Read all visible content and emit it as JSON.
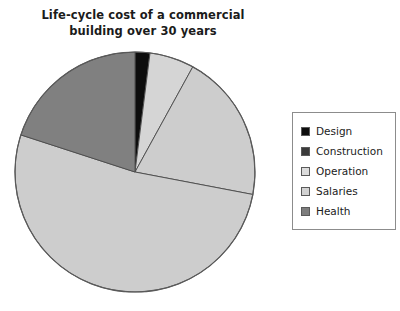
{
  "chart_data": {
    "type": "pie",
    "title": "Life-cycle cost of a commercial\nbuilding over 30 years",
    "title_line1": "Life-cycle cost of a commercial",
    "title_line2": "building over 30 years",
    "xlabel": "",
    "ylabel": "",
    "legend_position": "right",
    "grid": false,
    "start_angle_deg": 90,
    "direction": "clockwise",
    "categories": [
      "Design",
      "Construction",
      "Operation",
      "Salaries",
      "Health"
    ],
    "values": [
      2,
      6,
      20,
      52,
      20
    ],
    "units": "percent",
    "slices": [
      {
        "label": "Design",
        "value": 2,
        "color": "#0d0d0d"
      },
      {
        "label": "Construction",
        "value": 6,
        "color": "#d5d5d5"
      },
      {
        "label": "Operation",
        "value": 20,
        "color": "#cdcdcd"
      },
      {
        "label": "Salaries",
        "value": 52,
        "color": "#cdcdcd"
      },
      {
        "label": "Health",
        "value": 20,
        "color": "#808080"
      }
    ],
    "colors": {
      "design": "#0d0d0d",
      "construction": "#3a3a3a",
      "operation": "#d9d9d9",
      "salaries": "#cfcfcf",
      "health": "#808080",
      "slice_outline": "#4a4a4a",
      "pie_outline": "#5a5a5a",
      "legend_border": "#8c8c8c",
      "background": "#ffffff",
      "text": "#1b1b1b"
    },
    "geometry": {
      "center_x": 135,
      "center_y": 172,
      "radius": 120
    }
  },
  "legend": {
    "items": [
      {
        "label": "Design",
        "swatch": "#0d0d0d"
      },
      {
        "label": "Construction",
        "swatch": "#3a3a3a"
      },
      {
        "label": "Operation",
        "swatch": "#dcdcdc"
      },
      {
        "label": "Salaries",
        "swatch": "#d2d2d2"
      },
      {
        "label": "Health",
        "swatch": "#7d7d7d"
      }
    ]
  }
}
